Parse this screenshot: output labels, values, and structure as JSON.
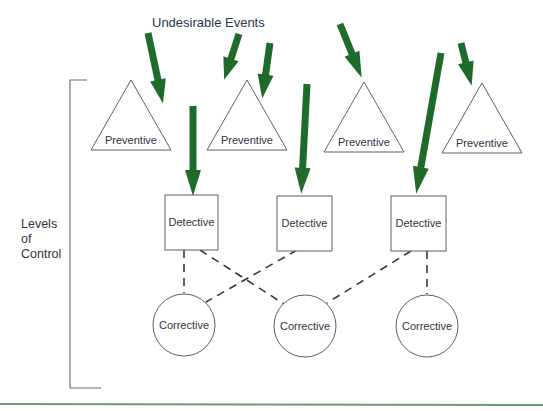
{
  "diagram": {
    "title": "Undesirable Events",
    "side_label": [
      "Levels",
      "of",
      "Control"
    ],
    "colors": {
      "arrow": "#1f6b2c",
      "stroke": "#5a5f66",
      "text": "#2f3442",
      "rule": "#6f9a78"
    },
    "preventive": [
      {
        "label": "Preventive"
      },
      {
        "label": "Preventive"
      },
      {
        "label": "Preventive"
      },
      {
        "label": "Preventive"
      }
    ],
    "detective": [
      {
        "label": "Detective"
      },
      {
        "label": "Detective"
      },
      {
        "label": "Detective"
      }
    ],
    "corrective": [
      {
        "label": "Corrective"
      },
      {
        "label": "Corrective"
      },
      {
        "label": "Corrective"
      }
    ],
    "connections": [
      {
        "from": "detective-1",
        "to": "corrective-1"
      },
      {
        "from": "detective-1",
        "to": "corrective-2"
      },
      {
        "from": "detective-2",
        "to": "corrective-1"
      },
      {
        "from": "detective-3",
        "to": "corrective-2"
      },
      {
        "from": "detective-3",
        "to": "corrective-3"
      }
    ]
  }
}
